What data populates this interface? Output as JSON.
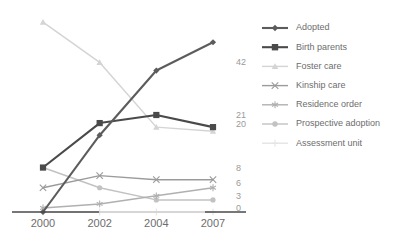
{
  "chart_data": {
    "type": "line",
    "title": "",
    "subtitle": "",
    "xlabel": "",
    "ylabel": "",
    "categories": [
      "2000",
      "2002",
      "2004",
      "2007"
    ],
    "x_tick_labels": [
      "2000",
      "2002",
      "2004",
      "2007"
    ],
    "ylim": [
      0,
      48
    ],
    "grid": false,
    "legend_position": "right",
    "end_value_labels": [
      "42",
      "21",
      "20",
      "8",
      "6",
      "3",
      "0"
    ],
    "series": [
      {
        "name": "Adopted",
        "marker": "diamond",
        "color": "#5c5c5c",
        "values": [
          0,
          19,
          35,
          42
        ],
        "end_label": "42"
      },
      {
        "name": "Birth parents",
        "marker": "square",
        "color": "#4a4a4a",
        "values": [
          11,
          22,
          24,
          21
        ],
        "end_label": "21"
      },
      {
        "name": "Foster care",
        "marker": "triangle",
        "color": "#d4d4d4",
        "values": [
          47,
          37,
          21,
          20
        ],
        "end_label": "20"
      },
      {
        "name": "Kinship care",
        "marker": "x",
        "color": "#9b9b9b",
        "values": [
          6,
          9,
          8,
          8
        ],
        "end_label": "8"
      },
      {
        "name": "Residence order",
        "marker": "asterisk",
        "color": "#b0b0b0",
        "values": [
          1,
          2,
          4,
          6
        ],
        "end_label": "6"
      },
      {
        "name": "Prospective adoption",
        "marker": "circle",
        "color": "#c2c2c2",
        "values": [
          11,
          6,
          3,
          3
        ],
        "end_label": "3"
      },
      {
        "name": "Assessment unit",
        "marker": "plus",
        "color": "#e4e4e4",
        "values": [
          0,
          0,
          0,
          0
        ],
        "end_label": "0"
      }
    ]
  },
  "legend": {
    "items": [
      {
        "label": "Adopted",
        "marker": "diamond",
        "color": "#5c5c5c"
      },
      {
        "label": "Birth parents",
        "marker": "square",
        "color": "#4a4a4a"
      },
      {
        "label": "Foster care",
        "marker": "triangle",
        "color": "#d4d4d4"
      },
      {
        "label": "Kinship care",
        "marker": "x",
        "color": "#9b9b9b"
      },
      {
        "label": "Residence order",
        "marker": "asterisk",
        "color": "#b0b0b0"
      },
      {
        "label": "Prospective adoption",
        "marker": "circle",
        "color": "#c2c2c2"
      },
      {
        "label": "Assessment unit",
        "marker": "plus",
        "color": "#e4e4e4"
      }
    ]
  },
  "axis": {
    "baseline_color": "#4a4a4a",
    "tick_label_color": "#6d6d6d"
  }
}
